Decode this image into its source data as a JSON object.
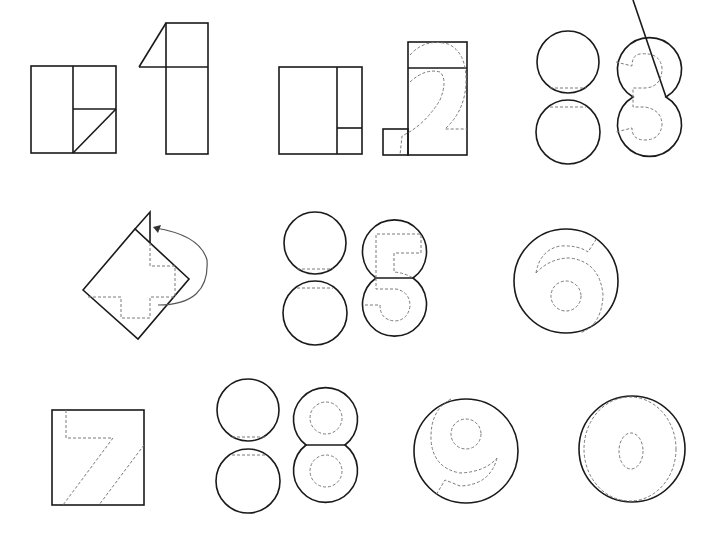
{
  "diagram": {
    "type": "digit-cutting-guide",
    "colors": {
      "background": "#ffffff",
      "cut_line": "#1a1a1a",
      "guide_line": "#7a7a7a",
      "arrow": "#555555"
    },
    "digits": [
      {
        "digit": "1",
        "base_shapes": [
          "square-split",
          "rectangle-with-triangle"
        ]
      },
      {
        "digit": "2",
        "base_shapes": [
          "square-split",
          "tall-rectangle-with-small-square"
        ]
      },
      {
        "digit": "3",
        "base_shapes": [
          "two-circles",
          "joined-circles"
        ]
      },
      {
        "digit": "4",
        "base_shapes": [
          "rotated-square-with-fold-arrow"
        ]
      },
      {
        "digit": "5",
        "base_shapes": [
          "two-circles",
          "joined-circles"
        ]
      },
      {
        "digit": "6",
        "base_shapes": [
          "single-circle"
        ]
      },
      {
        "digit": "7",
        "base_shapes": [
          "square"
        ]
      },
      {
        "digit": "8",
        "base_shapes": [
          "two-circles",
          "joined-circles"
        ]
      },
      {
        "digit": "9",
        "base_shapes": [
          "single-circle"
        ]
      },
      {
        "digit": "0",
        "base_shapes": [
          "single-circle"
        ]
      }
    ]
  }
}
